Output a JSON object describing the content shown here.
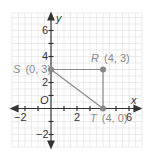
{
  "diagram": {
    "type": "coordinate-plane",
    "axes": {
      "x_label": "x",
      "y_label": "y",
      "origin_label": "O"
    },
    "x_ticks": [
      "−2",
      "2",
      "6"
    ],
    "y_ticks": [
      "6",
      "4",
      "2",
      "−2"
    ],
    "points": [
      {
        "name": "S",
        "coords": "(0, 3)",
        "x": 0,
        "y": 3
      },
      {
        "name": "R",
        "coords": "(4, 3)",
        "x": 4,
        "y": 3
      },
      {
        "name": "T",
        "coords": "(4, 0)",
        "x": 4,
        "y": 0
      }
    ],
    "segments": [
      [
        "S",
        "R"
      ],
      [
        "R",
        "T"
      ],
      [
        "S",
        "T"
      ]
    ],
    "colors": {
      "axis": "#333333",
      "grid": "#e2e2e2",
      "point": "#888888",
      "label": "#8a8a8a",
      "segment": "#8a8a8a"
    }
  }
}
